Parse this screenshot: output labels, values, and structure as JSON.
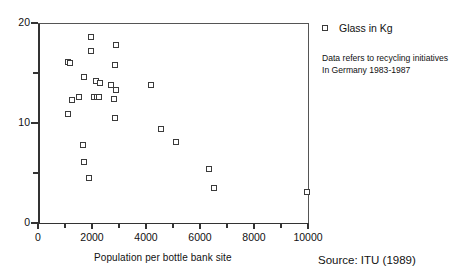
{
  "chart_data": {
    "type": "scatter",
    "title": "",
    "xlabel": "Population per bottle bank site",
    "ylabel": "",
    "xlim": [
      0,
      10000
    ],
    "ylim": [
      0,
      20
    ],
    "xticks": [
      0,
      1000,
      2000,
      3000,
      4000,
      5000,
      6000,
      7000,
      8000,
      9000,
      10000
    ],
    "xticklabels": [
      "0",
      "",
      "2000",
      "",
      "4000",
      "",
      "6000",
      "",
      "8000",
      "",
      "10000"
    ],
    "yticks": [
      0,
      5,
      10,
      15,
      20
    ],
    "yticklabels": [
      "0",
      "",
      "10",
      "",
      "20"
    ],
    "grid": false,
    "legend_position": "right",
    "series": [
      {
        "name": "Glass in Kg",
        "marker": "square",
        "color": "#3b3b3b",
        "points": [
          [
            1950,
            18.6
          ],
          [
            2900,
            17.8
          ],
          [
            1980,
            17.2
          ],
          [
            1100,
            16.1
          ],
          [
            1190,
            16.0
          ],
          [
            2850,
            15.8
          ],
          [
            1700,
            14.6
          ],
          [
            2140,
            14.2
          ],
          [
            2300,
            14.0
          ],
          [
            2720,
            13.8
          ],
          [
            4170,
            13.8
          ],
          [
            2900,
            13.3
          ],
          [
            1500,
            12.6
          ],
          [
            2090,
            12.6
          ],
          [
            2200,
            12.6
          ],
          [
            2250,
            12.6
          ],
          [
            2830,
            12.4
          ],
          [
            1250,
            12.3
          ],
          [
            1100,
            10.9
          ],
          [
            2860,
            10.5
          ],
          [
            4550,
            9.4
          ],
          [
            5100,
            8.1
          ],
          [
            1650,
            7.8
          ],
          [
            1700,
            6.1
          ],
          [
            1880,
            4.5
          ],
          [
            6350,
            5.4
          ],
          [
            6500,
            3.5
          ],
          [
            9950,
            3.1
          ]
        ]
      }
    ],
    "annotations": {
      "note_line_1": "Data refers to recycling initiatives",
      "note_line_2": "In Germany 1983-1987",
      "source": "Source: ITU (1989)"
    }
  },
  "legend": {
    "entry_label": "Glass in Kg"
  }
}
